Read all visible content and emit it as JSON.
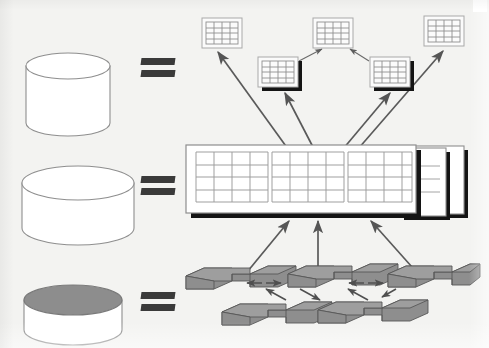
{
  "figure": {
    "background_color": "#f3f3f1",
    "rows": [
      {
        "id": "row-conceptual",
        "cylinder_label": "database-cylinder-top",
        "cylinder_style": "white-top",
        "equals_sign": "=",
        "right_side": "table-icons-cluster"
      },
      {
        "id": "row-logical",
        "cylinder_label": "database-cylinder-middle",
        "cylinder_style": "white-top-wide",
        "equals_sign": "=",
        "right_side": "stacked-table-panel"
      },
      {
        "id": "row-physical",
        "cylinder_label": "database-cylinder-bottom",
        "cylinder_style": "shaded-top",
        "equals_sign": "=",
        "right_side": "storage-block-cluster"
      }
    ]
  },
  "colors": {
    "page": "#f3f3f1",
    "outline": "#8a8a8a",
    "grid_line": "#9a9a9a",
    "arrow": "#555555",
    "shadow": "#141414",
    "block_top": "#9c9c9c",
    "block_front": "#8e8e8e",
    "block_side": "#7e7e7e",
    "cylinder_shaded_top": "#8d8d8d",
    "equals": "#3a3a3a"
  },
  "cylinders": [
    {
      "name": "database-cylinder-top",
      "cx": 68,
      "cy": 66,
      "rx": 42,
      "body_h": 70,
      "ry": 13,
      "top_fill": "#ffffff"
    },
    {
      "name": "database-cylinder-middle",
      "cx": 78,
      "cy": 183,
      "rx": 56,
      "body_h": 62,
      "ry": 17,
      "top_fill": "#ffffff"
    },
    {
      "name": "database-cylinder-bottom",
      "cx": 73,
      "cy": 300,
      "rx": 49,
      "body_h": 60,
      "ry": 15,
      "top_fill": "#8d8d8d"
    }
  ],
  "equals_signs": [
    {
      "name": "equals-sign-top",
      "x": 141,
      "y": 58
    },
    {
      "name": "equals-sign-middle",
      "x": 141,
      "y": 176
    },
    {
      "name": "equals-sign-bottom",
      "x": 141,
      "y": 292
    }
  ],
  "table_icons": [
    {
      "name": "table-icon-1",
      "x": 202,
      "y": 18,
      "w": 40,
      "h": 30,
      "cols": 4,
      "rows": 4,
      "shadow": false
    },
    {
      "name": "table-icon-2",
      "x": 258,
      "y": 57,
      "w": 40,
      "h": 30,
      "cols": 4,
      "rows": 4,
      "shadow": true
    },
    {
      "name": "table-icon-3",
      "x": 313,
      "y": 18,
      "w": 40,
      "h": 30,
      "cols": 4,
      "rows": 4,
      "shadow": false
    },
    {
      "name": "table-icon-4",
      "x": 370,
      "y": 57,
      "w": 40,
      "h": 30,
      "cols": 4,
      "rows": 4,
      "shadow": true
    },
    {
      "name": "table-icon-5",
      "x": 424,
      "y": 16,
      "w": 40,
      "h": 30,
      "cols": 4,
      "rows": 4,
      "shadow": false
    }
  ],
  "central_panel": {
    "name": "stacked-table-panel",
    "x": 186,
    "y": 145,
    "w": 230,
    "h": 68,
    "grids": [
      {
        "name": "panel-grid-1",
        "cols": 4,
        "rows": 4
      },
      {
        "name": "panel-grid-2",
        "cols": 4,
        "rows": 4
      },
      {
        "name": "panel-grid-3",
        "cols": 4,
        "rows": 4
      }
    ],
    "back_sheets": 2,
    "back_sheet_grid": {
      "name": "panel-back-grid",
      "cols": 1,
      "rows": 4
    }
  },
  "storage_blocks": {
    "name": "storage-block-cluster",
    "top_row": [
      {
        "name": "storage-block-group-1",
        "x": 186,
        "y": 266
      },
      {
        "name": "storage-block-group-2",
        "x": 288,
        "y": 264
      },
      {
        "name": "storage-block-group-3",
        "x": 388,
        "y": 264
      }
    ],
    "bottom_row": [
      {
        "name": "storage-block-group-4",
        "x": 222,
        "y": 302
      },
      {
        "name": "storage-block-group-5",
        "x": 318,
        "y": 300
      }
    ]
  },
  "arrows": {
    "panel_to_tables": [
      {
        "name": "arrow-panel-to-table-1",
        "x1": 288,
        "y1": 150,
        "x2": 216,
        "y2": 53
      },
      {
        "name": "arrow-panel-to-table-2",
        "x1": 313,
        "y1": 150,
        "x2": 281,
        "y2": 92
      },
      {
        "name": "arrow-panel-to-table-3",
        "x1": 341,
        "y1": 150,
        "x2": 392,
        "y2": 92
      },
      {
        "name": "arrow-panel-to-table-4",
        "x1": 356,
        "y1": 150,
        "x2": 444,
        "y2": 52
      }
    ],
    "table_to_table": [
      {
        "name": "arrow-table-2-to-3",
        "x1": 300,
        "y1": 60,
        "x2": 322,
        "y2": 50
      },
      {
        "name": "arrow-table-4-to-3",
        "x1": 368,
        "y1": 60,
        "x2": 352,
        "y2": 50
      }
    ],
    "blocks_to_panel": [
      {
        "name": "arrow-block-to-panel-left",
        "x1": 243,
        "y1": 275,
        "x2": 288,
        "y2": 220
      },
      {
        "name": "arrow-block-to-panel-center",
        "x1": 318,
        "y1": 278,
        "x2": 318,
        "y2": 220
      },
      {
        "name": "arrow-block-to-panel-right",
        "x1": 418,
        "y1": 274,
        "x2": 368,
        "y2": 220
      }
    ],
    "block_to_block": [
      {
        "name": "arrow-blocks-1-2",
        "x1": 249,
        "y1": 282,
        "x2": 277,
        "y2": 282
      },
      {
        "name": "arrow-blocks-2-3",
        "x1": 350,
        "y1": 282,
        "x2": 378,
        "y2": 282
      },
      {
        "name": "arrow-blocks-1-4",
        "x1": 284,
        "y1": 299,
        "x2": 262,
        "y2": 289
      },
      {
        "name": "arrow-blocks-2-4",
        "x1": 300,
        "y1": 289,
        "x2": 322,
        "y2": 299
      },
      {
        "name": "arrow-blocks-2-5",
        "x1": 368,
        "y1": 299,
        "x2": 346,
        "y2": 289
      }
    ]
  }
}
